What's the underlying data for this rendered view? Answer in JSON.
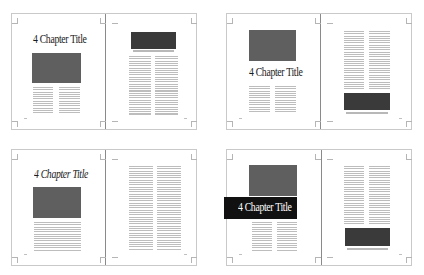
{
  "figure": {
    "colors": {
      "page_border": "#c9c9c9",
      "gutter": "#8a8a8a",
      "image_block": "#5f5f5f",
      "dark_block": "#3a3a3a",
      "text_lines": "#bdbdbd",
      "title_band": "#111111"
    },
    "spreads": [
      {
        "id": "spread-1",
        "title": "4 Chapter Title",
        "title_style": "roman, above image"
      },
      {
        "id": "spread-2",
        "title": "4 Chapter Title",
        "title_style": "roman, below image"
      },
      {
        "id": "spread-3",
        "title": "4 Chapter Title",
        "title_style": "italic, above image"
      },
      {
        "id": "spread-4",
        "title": "4 Chapter Title",
        "title_style": "reversed white on black band bleeding left"
      }
    ]
  }
}
